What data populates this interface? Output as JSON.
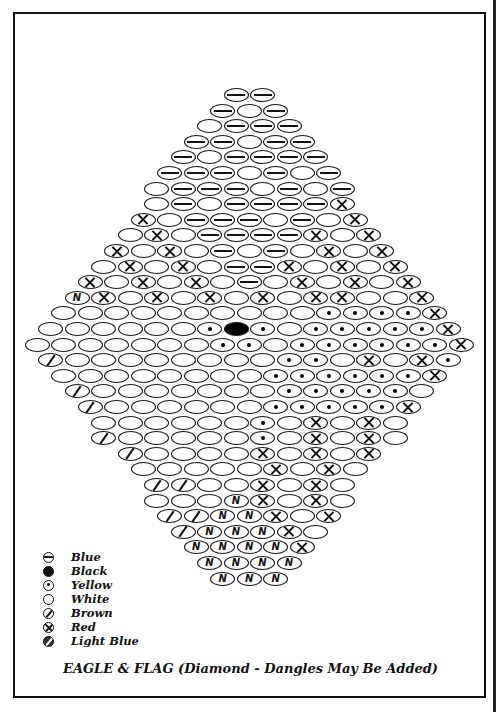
{
  "title": "EAGLE & FLAG (Diamond -  Dangles May Be Added)",
  "legend": [
    {
      "code": "B",
      "label": "Blue",
      "icon": "circle-dash-icon",
      "cls": "ls-blue"
    },
    {
      "code": "K",
      "label": "Black",
      "icon": "filled-circle-icon",
      "cls": "ls-black"
    },
    {
      "code": "Y",
      "label": "Yellow",
      "icon": "circle-dot-icon",
      "cls": "ls-yellow"
    },
    {
      "code": "W",
      "label": "White",
      "icon": "empty-circle-icon",
      "cls": "ls-white"
    },
    {
      "code": "N",
      "label": "Brown",
      "icon": "circle-slash-icon",
      "cls": "ls-brown"
    },
    {
      "code": "R",
      "label": "Red",
      "icon": "circle-x-icon",
      "cls": "ls-red"
    },
    {
      "code": "L",
      "label": "Light Blue",
      "icon": "circle-zigzag-icon",
      "cls": "ls-lightblue"
    }
  ],
  "pattern": {
    "center_x": 250,
    "top_y": 95,
    "row_step": 15.6,
    "bead_step": 26.5,
    "rows": [
      "BB",
      "BWB",
      "WBBB",
      "BBWBB",
      "BWBBBB",
      "BBBWBWB",
      "WBBBWBWB",
      "WBWBBBBR",
      "RWBBBWBWR",
      "WRWBBBBRWR",
      "RWRWBWBWRWR",
      "WRWRWBBRWRWR",
      "RWRWRWBWRWRWR",
      "LRWRWRWRWRRWWR",
      "WWWWWWWWWWYYYYR",
      "WWWWWWYKYWYYYYYR",
      "WWWWWWWYYWYYYYYYR",
      "NWWWWWWWWYYWRWRY",
      "WWWWWWWWYYYYYYR",
      "NWWWWWWWYYYYYW",
      "NWWWWWWYYYYYR",
      "WWWWWWYWRWRW",
      "NWWWWWYWRWRW",
      "NWWWWRWRWR",
      "WWWWWRWRW",
      "NNWWRWRW",
      "WWWLRWRW",
      "NNLLRWR",
      "NLLLRW",
      "LLLLR",
      "LLLL",
      "LLL"
    ]
  }
}
